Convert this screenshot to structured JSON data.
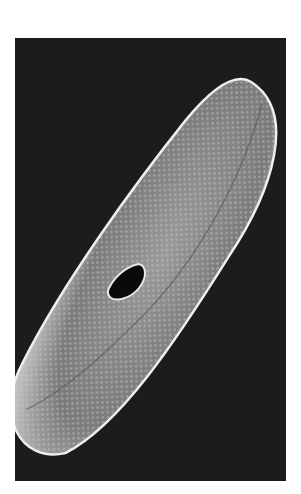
{
  "image": {
    "subject": "paramecium-sem",
    "alt": "Scanning electron micrograph of a paramecium showing cilia rows and oral groove",
    "colors": {
      "page_background": "#ffffff",
      "frame_background": "#1c1c1c",
      "cell_body": "#8a8a8a",
      "cell_highlight": "#e8e8e8",
      "oral_groove": "#0a0a0a"
    }
  }
}
